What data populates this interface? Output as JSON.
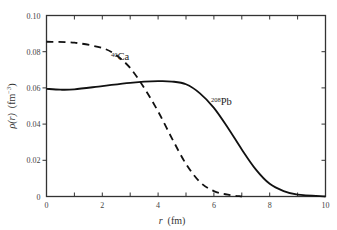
{
  "chart_data": {
    "type": "line",
    "title": "",
    "xlabel": "r  (fm)",
    "ylabel": "ρ(r)  (fm⁻³)",
    "xlim": [
      0,
      10
    ],
    "ylim": [
      0,
      0.1
    ],
    "x_ticks": [
      "0",
      "2",
      "4",
      "6",
      "8",
      "10"
    ],
    "y_ticks": [
      "0",
      "0.02",
      "0.04",
      "0.06",
      "0.08",
      "0.10"
    ],
    "grid": false,
    "legend": "inline labels",
    "series": [
      {
        "name": "40Ca",
        "label_mass": "40",
        "label_symbol": "Ca",
        "style": "dashed",
        "x": [
          0,
          1,
          2,
          2.5,
          3,
          3.5,
          4,
          4.5,
          5,
          5.5,
          6,
          6.5,
          7
        ],
        "values": [
          0.0855,
          0.085,
          0.082,
          0.078,
          0.071,
          0.06,
          0.047,
          0.032,
          0.018,
          0.008,
          0.003,
          0.001,
          0.0
        ]
      },
      {
        "name": "208Pb",
        "label_mass": "208",
        "label_symbol": "Pb",
        "style": "solid",
        "x": [
          0,
          0.5,
          1,
          2,
          3,
          4,
          4.5,
          5,
          5.5,
          6,
          6.5,
          7,
          7.5,
          8,
          8.5,
          9,
          10
        ],
        "values": [
          0.0595,
          0.059,
          0.0592,
          0.061,
          0.0628,
          0.0637,
          0.0635,
          0.062,
          0.057,
          0.049,
          0.038,
          0.026,
          0.015,
          0.007,
          0.003,
          0.001,
          0.0
        ]
      }
    ]
  },
  "axes": {
    "x_label_var": "r",
    "x_label_unit": "(fm)",
    "y_label_var": "ρ(r)",
    "y_label_unit": "(fm",
    "y_label_exp": "−3",
    "y_label_close": ")"
  },
  "colors": {
    "line": "#111111",
    "axis": "#333333"
  }
}
